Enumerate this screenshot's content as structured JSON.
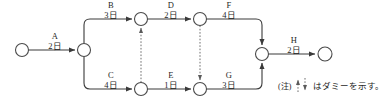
{
  "diagram": {
    "type": "pert-arrow-network",
    "title": "",
    "nodes": [
      {
        "id": "n1",
        "name": "start-node",
        "x": 22,
        "y": 50
      },
      {
        "id": "n2",
        "name": "split-node",
        "x": 84,
        "y": 50
      },
      {
        "id": "n3",
        "name": "node-b-end",
        "x": 141,
        "y": 19
      },
      {
        "id": "n4",
        "name": "node-d-end",
        "x": 200,
        "y": 19
      },
      {
        "id": "n5",
        "name": "node-c-end",
        "x": 141,
        "y": 89
      },
      {
        "id": "n6",
        "name": "node-e-end",
        "x": 200,
        "y": 89
      },
      {
        "id": "n7",
        "name": "merge-node",
        "x": 262,
        "y": 54
      },
      {
        "id": "n8",
        "name": "end-node",
        "x": 325,
        "y": 54
      }
    ],
    "node_radius": 6.5,
    "activities": [
      {
        "id": "A",
        "label": "A",
        "duration": "2日",
        "days": 2,
        "from": "n1",
        "to": "n2",
        "label_x": 55,
        "label_y": 38
      },
      {
        "id": "B",
        "label": "B",
        "duration": "3日",
        "days": 3,
        "from": "n2",
        "to": "n3",
        "label_x": 111,
        "label_y": 6
      },
      {
        "id": "D",
        "label": "D",
        "duration": "2日",
        "days": 2,
        "from": "n3",
        "to": "n4",
        "label_x": 171,
        "label_y": 6
      },
      {
        "id": "F",
        "label": "F",
        "duration": "4日",
        "days": 4,
        "from": "n4",
        "to": "n7",
        "label_x": 228,
        "label_y": 6
      },
      {
        "id": "C",
        "label": "C",
        "duration": "4日",
        "days": 4,
        "from": "n2",
        "to": "n5",
        "label_x": 111,
        "label_y": 77
      },
      {
        "id": "E",
        "label": "E",
        "duration": "1日",
        "days": 1,
        "from": "n5",
        "to": "n6",
        "label_x": 171,
        "label_y": 77
      },
      {
        "id": "G",
        "label": "G",
        "duration": "3日",
        "days": 3,
        "from": "n6",
        "to": "n7",
        "label_x": 228,
        "label_y": 77
      },
      {
        "id": "H",
        "label": "H",
        "duration": "2日",
        "days": 2,
        "from": "n7",
        "to": "n8",
        "label_x": 294,
        "label_y": 42
      }
    ],
    "dummies": [
      {
        "id": "dummy1",
        "name": "dummy-arrow-up",
        "from": "n5",
        "to": "n3",
        "direction": "up",
        "x": 141
      },
      {
        "id": "dummy2",
        "name": "dummy-arrow-down",
        "from": "n4",
        "to": "n6",
        "direction": "down",
        "x": 200
      }
    ]
  },
  "legend": {
    "note_marker": "(注)",
    "text": "はダミーを示す。"
  }
}
